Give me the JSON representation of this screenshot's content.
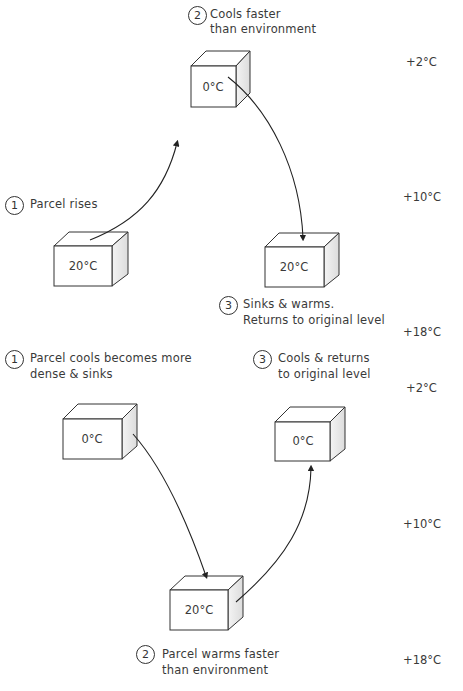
{
  "top_panel": {
    "steps": [
      {
        "number": "1",
        "line1": "Parcel rises",
        "line2": ""
      },
      {
        "number": "2",
        "line1": "Cools faster",
        "line2": "than environment"
      },
      {
        "number": "3",
        "line1": "Sinks & warms.",
        "line2": "Returns to original level"
      }
    ],
    "cubes": [
      {
        "label": "0°C"
      },
      {
        "label": "20°C"
      },
      {
        "label": "20°C"
      }
    ],
    "env_temps": [
      "+2°C",
      "+10°C",
      "+18°C"
    ]
  },
  "bottom_panel": {
    "steps": [
      {
        "number": "1",
        "line1": "Parcel cools becomes more",
        "line2": "dense & sinks"
      },
      {
        "number": "2",
        "line1": "Parcel warms faster",
        "line2": "than environment"
      },
      {
        "number": "3",
        "line1": "Cools & returns",
        "line2": "to original level"
      }
    ],
    "cubes": [
      {
        "label": "0°C"
      },
      {
        "label": "0°C"
      },
      {
        "label": "20°C"
      }
    ],
    "env_temps": [
      "+2°C",
      "+10°C",
      "+18°C"
    ]
  }
}
